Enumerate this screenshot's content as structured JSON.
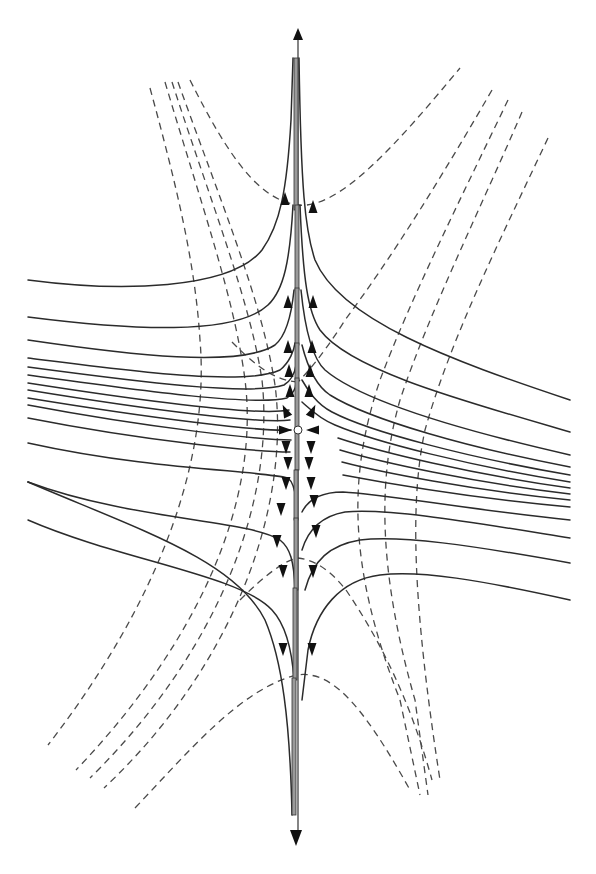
{
  "figure": {
    "title": "",
    "colors": {
      "stream": "#2b2b2b",
      "dashed": "#4a4a4a",
      "arrow": "#111111",
      "axis_fill": "#9a9a9a",
      "background": "#ffffff"
    },
    "central_axis": {
      "x": 298,
      "top_arrow": {
        "tip": [
          298,
          28
        ],
        "direction": "up"
      },
      "bottom_arrow": {
        "tip": [
          296,
          846
        ],
        "direction": "down"
      },
      "segments": [
        {
          "x": 296,
          "y1": 58,
          "y2": 210
        },
        {
          "x": 297,
          "y1": 205,
          "y2": 290
        },
        {
          "x": 297,
          "y1": 288,
          "y2": 345
        },
        {
          "x": 297,
          "y1": 343,
          "y2": 380
        },
        {
          "x": 297,
          "y1": 378,
          "y2": 430
        },
        {
          "x": 297,
          "y1": 430,
          "y2": 470
        },
        {
          "x": 296,
          "y1": 470,
          "y2": 520
        },
        {
          "x": 296,
          "y1": 518,
          "y2": 590
        },
        {
          "x": 295,
          "y1": 588,
          "y2": 680
        },
        {
          "x": 294,
          "y1": 678,
          "y2": 815
        }
      ]
    },
    "streamlines_left_upper": [
      "M28,280 C120,292 230,290 262,250 C280,225 287,190 291,120 L293,58",
      "M28,317 C130,330 235,336 268,305 C284,290 290,260 293,205",
      "M28,340 C130,355 240,368 275,345 C287,335 292,310 294,290",
      "M28,358 C140,372 245,386 280,370 C290,362 294,350 295,343",
      "M28,367 C140,382 250,396 284,385 C292,380 295,372 296,365",
      "M28,375 C150,392 255,406 287,398 C293,394 296,388 296,382",
      "M28,383 C150,402 260,416 289,410",
      "M28,390 C150,410 262,424 290,420",
      "M28,398 C150,418 262,432 291,430"
    ],
    "streamlines_left_lower": [
      "M28,405 C150,428 262,440 291,440",
      "M28,418 C150,442 260,452 290,452",
      "M28,443 C150,470 255,470 288,478 C293,482 295,490 296,500",
      "M28,482 C130,520 250,520 280,540 C290,548 294,560 295,590",
      "M28,520 C120,560 240,575 272,610 C286,625 292,650 294,680",
      "M28,482 C28,482 28,482 28,482"
    ],
    "streamlines_left_bottom": [
      "M28,482 C140,530 235,560 265,620 C282,660 290,720 292,815"
    ],
    "streamlines_right_upper": [
      "M570,400 C450,360 340,320 315,260 C305,230 301,190 299,58",
      "M570,432 C460,400 350,370 320,330 C308,312 303,280 300,205",
      "M570,455 C460,430 360,400 325,370 C312,358 305,330 301,290",
      "M570,467 C470,448 370,420 330,395 C315,385 307,365 302,345",
      "M570,475 C470,458 370,432 332,412 C316,404 308,390 302,380",
      "M570,482 C470,466 375,442 335,425 C318,418 309,408 302,402",
      "M570,488 C470,474 380,452 338,438",
      "M570,494 C470,482 380,462 340,450",
      "M570,500 C470,490 380,472 342,462"
    ],
    "streamlines_right_lower": [
      "M570,507 C470,498 380,482 343,475",
      "M570,520 C470,510 385,494 343,492 C320,492 308,500 302,512",
      "M570,538 C470,522 390,508 345,512 C322,516 308,530 302,550",
      "M570,563 C470,545 400,535 360,540 C330,545 313,560 305,590",
      "M570,600 C480,580 420,570 380,575 C340,580 316,610 308,650 L302,700"
    ],
    "dashed_curves": [
      "M190,80 C230,160 260,200 298,205 C340,210 400,140 460,68",
      "M150,88 C175,180 195,260 200,340 C210,460 160,600 48,745",
      "M165,82 C200,200 235,300 245,380 C260,500 200,640 76,770",
      "M172,82 C210,200 250,300 262,380 C275,500 220,650 90,778",
      "M178,82 C220,200 262,300 275,385 C290,500 240,660 104,788",
      "M492,90 C440,180 390,260 345,320 C320,360 300,380 298,382",
      "M508,100 C460,200 410,300 380,380 C350,470 345,560 400,700 L420,795",
      "M522,112 C480,210 430,310 400,400 C380,470 375,560 415,700 L428,795",
      "M548,138 C500,240 450,340 425,430 C410,500 412,600 440,780",
      "M298,382 C270,380 250,360 230,340",
      "M135,808 C190,750 240,690 296,675 C330,670 360,700 410,790",
      "M240,600 C265,575 285,560 298,558 C315,560 330,570 346,590",
      "M346,590 C380,640 410,700 432,780"
    ],
    "arrows": [
      {
        "x": 285,
        "y": 200,
        "dir": "up"
      },
      {
        "x": 313,
        "y": 208,
        "dir": "up"
      },
      {
        "x": 288,
        "y": 303,
        "dir": "up"
      },
      {
        "x": 313,
        "y": 303,
        "dir": "up"
      },
      {
        "x": 288,
        "y": 348,
        "dir": "up"
      },
      {
        "x": 312,
        "y": 348,
        "dir": "up"
      },
      {
        "x": 289,
        "y": 372,
        "dir": "up"
      },
      {
        "x": 310,
        "y": 372,
        "dir": "up"
      },
      {
        "x": 290,
        "y": 392,
        "dir": "up"
      },
      {
        "x": 309,
        "y": 392,
        "dir": "up"
      },
      {
        "x": 286,
        "y": 412,
        "dir": "up-left"
      },
      {
        "x": 312,
        "y": 412,
        "dir": "up-right"
      },
      {
        "x": 284,
        "y": 430,
        "dir": "right"
      },
      {
        "x": 314,
        "y": 430,
        "dir": "left"
      },
      {
        "x": 286,
        "y": 446,
        "dir": "down"
      },
      {
        "x": 311,
        "y": 446,
        "dir": "down"
      },
      {
        "x": 288,
        "y": 462,
        "dir": "down"
      },
      {
        "x": 309,
        "y": 462,
        "dir": "down"
      },
      {
        "x": 286,
        "y": 482,
        "dir": "down"
      },
      {
        "x": 311,
        "y": 482,
        "dir": "down"
      },
      {
        "x": 281,
        "y": 508,
        "dir": "down"
      },
      {
        "x": 314,
        "y": 500,
        "dir": "down"
      },
      {
        "x": 277,
        "y": 540,
        "dir": "down"
      },
      {
        "x": 316,
        "y": 530,
        "dir": "down"
      },
      {
        "x": 283,
        "y": 648,
        "dir": "down"
      },
      {
        "x": 312,
        "y": 648,
        "dir": "down"
      },
      {
        "x": 283,
        "y": 570,
        "dir": "down"
      },
      {
        "x": 313,
        "y": 570,
        "dir": "down"
      }
    ],
    "center_point": {
      "x": 298,
      "y": 430,
      "r": 4
    }
  }
}
